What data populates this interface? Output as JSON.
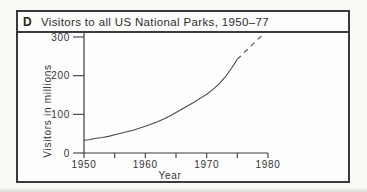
{
  "panel": {
    "label": "D",
    "title": "Visitors to all US National Parks, 1950–77"
  },
  "colors": {
    "ink": "#3a3a3a",
    "curve": "#4a4a4a",
    "text": "#333333",
    "paper": "#fefefe"
  },
  "chart_data": {
    "type": "line",
    "title": "Visitors to all US National Parks, 1950–77",
    "xlabel": "Year",
    "ylabel": "Visitors in millions",
    "xlim": [
      1950,
      1980
    ],
    "ylim": [
      0,
      300
    ],
    "x_ticks_major": [
      1950,
      1960,
      1970,
      1980
    ],
    "x_ticks_minor": [
      1955,
      1965,
      1975
    ],
    "y_ticks": [
      0,
      100,
      200,
      300
    ],
    "grid": false,
    "legend": "none",
    "plot_px": {
      "x": [
        84,
        268
      ],
      "y": [
        153,
        37
      ]
    },
    "series": [
      {
        "name": "observed",
        "style": "solid",
        "points": [
          [
            1950,
            33
          ],
          [
            1951,
            35
          ],
          [
            1952,
            38
          ],
          [
            1953,
            40
          ],
          [
            1954,
            43
          ],
          [
            1955,
            47
          ],
          [
            1956,
            51
          ],
          [
            1957,
            55
          ],
          [
            1958,
            59
          ],
          [
            1959,
            64
          ],
          [
            1960,
            69
          ],
          [
            1961,
            75
          ],
          [
            1962,
            81
          ],
          [
            1963,
            88
          ],
          [
            1964,
            96
          ],
          [
            1965,
            105
          ],
          [
            1966,
            114
          ],
          [
            1967,
            123
          ],
          [
            1968,
            132
          ],
          [
            1969,
            142
          ],
          [
            1970,
            152
          ],
          [
            1971,
            164
          ],
          [
            1972,
            178
          ],
          [
            1973,
            196
          ],
          [
            1974,
            218
          ],
          [
            1975,
            242
          ]
        ]
      },
      {
        "name": "projected",
        "style": "dashed",
        "points": [
          [
            1975,
            242
          ],
          [
            1976,
            258
          ],
          [
            1977,
            273
          ],
          [
            1978,
            289
          ],
          [
            1979,
            304
          ]
        ]
      }
    ]
  }
}
